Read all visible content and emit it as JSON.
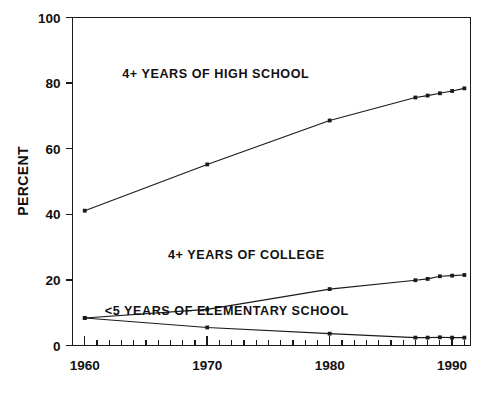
{
  "chart_data": {
    "type": "line",
    "title": "",
    "subtitle": "",
    "xlabel": "",
    "ylabel": "PERCENT",
    "xlim": [
      1959,
      1991.5
    ],
    "ylim": [
      0,
      100
    ],
    "grid": false,
    "legend_position": "inline-annotations",
    "x_ticks_major": [
      1960,
      1970,
      1980,
      1990
    ],
    "x_tick_labels": [
      "1960",
      "1970",
      "1980",
      "1990"
    ],
    "x_minor_tick_step": 1,
    "y_ticks": [
      0,
      20,
      40,
      60,
      80,
      100
    ],
    "y_tick_labels": [
      "0",
      "20",
      "40",
      "60",
      "80",
      "100"
    ],
    "series": [
      {
        "name": "4+ YEARS OF HIGH SCHOOL",
        "annotation": "4+ YEARS OF HIGH SCHOOL",
        "x": [
          1960,
          1970,
          1980,
          1987,
          1988,
          1989,
          1990,
          1991
        ],
        "values": [
          41.1,
          55.2,
          68.6,
          75.6,
          76.2,
          76.9,
          77.6,
          78.4
        ]
      },
      {
        "name": "4+ YEARS OF COLLEGE",
        "annotation": "4+ YEARS OF COLLEGE",
        "x": [
          1960,
          1970,
          1980,
          1987,
          1988,
          1989,
          1990,
          1991
        ],
        "values": [
          8.4,
          11.0,
          17.2,
          19.9,
          20.3,
          21.1,
          21.3,
          21.5
        ]
      },
      {
        "name": "<5 YEARS OF ELEMENTARY SCHOOL",
        "annotation": "<5 YEARS OF ELEMENTARY SCHOOL",
        "x": [
          1960,
          1970,
          1980,
          1987,
          1988,
          1989,
          1990,
          1991
        ],
        "values": [
          8.4,
          5.5,
          3.6,
          2.4,
          2.4,
          2.5,
          2.4,
          2.4
        ]
      }
    ],
    "annotations": [
      {
        "text": "4+ YEARS OF HIGH SCHOOL",
        "x": 1970.7,
        "y": 81.5
      },
      {
        "text": "4+ YEARS OF COLLEGE",
        "x": 1973.2,
        "y": 26.5
      },
      {
        "text": "<5 YEARS OF ELEMENTARY SCHOOL",
        "x": 1971.6,
        "y": 9.2
      }
    ],
    "colors": {
      "axis": "#1a1a1a",
      "line": "#1a1a1a",
      "marker": "#1a1a1a",
      "background": "#ffffff",
      "text": "#111111"
    }
  }
}
